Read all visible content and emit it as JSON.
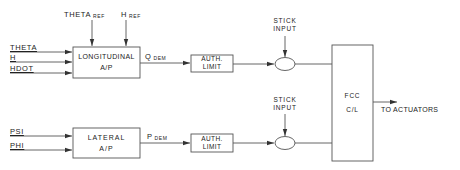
{
  "diagram": {
    "longitudinal": {
      "inputs": [
        "THETA",
        "H",
        "HDOT"
      ],
      "refs": [
        {
          "main": "THETA",
          "sub": "REF"
        },
        {
          "main": "H",
          "sub": "REF"
        }
      ],
      "block_line1": "LONGITUDINAL",
      "block_line2": "A/P",
      "output": {
        "main": "Q",
        "sub": "DEM"
      },
      "limit_line1": "AUTH.",
      "limit_line2": "LIMIT",
      "stick_line1": "STICK",
      "stick_line2": "INPUT"
    },
    "lateral": {
      "inputs": [
        "PSI",
        "PHI"
      ],
      "block_line1": "LATERAL",
      "block_line2": "A/P",
      "output": {
        "main": "P",
        "sub": "DEM"
      },
      "limit_line1": "AUTH.",
      "limit_line2": "LIMIT",
      "stick_line1": "STICK",
      "stick_line2": "INPUT"
    },
    "fcc": {
      "line1": "FCC",
      "line2": "C/L",
      "output": "TO ACTUATORS"
    }
  }
}
